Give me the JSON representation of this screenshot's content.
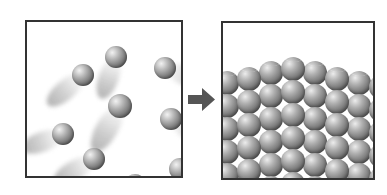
{
  "figure": {
    "background_color": "#ffffff",
    "width": 387,
    "height": 195
  },
  "panels": [
    {
      "id": "gas-panel",
      "name": "gas-state-panel",
      "label": "Gas / disordered moving particles",
      "border_color": "#333333",
      "fill_color": "#ffffff",
      "x": 25,
      "y": 20,
      "width": 158,
      "height": 158,
      "particle_count": 8,
      "particle_color": "#8e8e8e",
      "trail_color": "#b4b4b4"
    },
    {
      "id": "solid-panel",
      "name": "solid-state-panel",
      "label": "Solid / ordered crystal lattice",
      "border_color": "#333333",
      "fill_color": "#ffffff",
      "x": 221,
      "y": 21,
      "width": 154,
      "height": 159,
      "lattice_columns": 8,
      "lattice_rows": 6,
      "particle_color": "#8d8d8d"
    }
  ],
  "arrow": {
    "name": "transition-arrow",
    "direction": "right",
    "color": "#555555",
    "x": 188,
    "y": 86,
    "width": 27,
    "height": 27
  },
  "chart_data": {
    "type": "diagram",
    "gas_particles": [
      {
        "cx": 56,
        "cy": 53,
        "r": 11,
        "trail_angle": 140,
        "trail_length": 46
      },
      {
        "cx": 89,
        "cy": 35,
        "r": 11,
        "trail_angle": 110,
        "trail_length": 44
      },
      {
        "cx": 138,
        "cy": 46,
        "r": 11,
        "trail_angle": 20,
        "trail_length": 48
      },
      {
        "cx": 93,
        "cy": 84,
        "r": 12,
        "trail_angle": 120,
        "trail_length": 52
      },
      {
        "cx": 144,
        "cy": 97,
        "r": 11,
        "trail_angle": 30,
        "trail_length": 46
      },
      {
        "cx": 36,
        "cy": 112,
        "r": 11,
        "trail_angle": 160,
        "trail_length": 44
      },
      {
        "cx": 67,
        "cy": 137,
        "r": 11,
        "trail_angle": 150,
        "trail_length": 46
      },
      {
        "cx": 108,
        "cy": 163,
        "r": 11,
        "trail_angle": 128,
        "trail_length": 48
      },
      {
        "cx": 153,
        "cy": 147,
        "r": 11,
        "trail_angle": 40,
        "trail_length": 46
      }
    ],
    "lattice_surface_profile": [
      48,
      44,
      38,
      34,
      38,
      44,
      48,
      52
    ],
    "lattice_spacing_x": 22,
    "lattice_spacing_y": 23,
    "sphere_radius": 12
  }
}
